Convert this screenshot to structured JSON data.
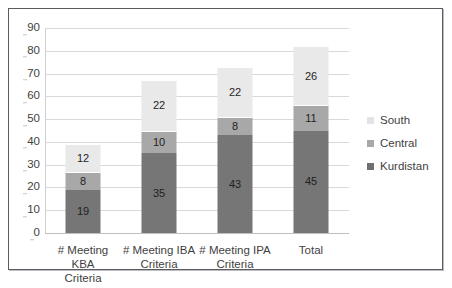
{
  "chart_data": {
    "type": "bar",
    "stacked": true,
    "title": "",
    "subtitle": "",
    "xlabel": "",
    "ylabel": "",
    "ylim": [
      0,
      90
    ],
    "ytick_step": 10,
    "ytick_labels": [
      "0",
      "10",
      "20",
      "30",
      "40",
      "50",
      "60",
      "70",
      "80",
      "90"
    ],
    "grid": true,
    "legend_position": "right",
    "categories": [
      "# Meeting KBA Criteria",
      "# Meeting IBA Criteria",
      "# Meeting IPA Criteria",
      "Total"
    ],
    "category_lines": [
      [
        "# Meeting KBA",
        "Criteria"
      ],
      [
        "# Meeting IBA",
        "Criteria"
      ],
      [
        "# Meeting IPA",
        "Criteria"
      ],
      [
        "Total",
        ""
      ]
    ],
    "series": [
      {
        "name": "Kurdistan",
        "color": "#767676",
        "values": [
          19,
          35,
          43,
          45
        ],
        "labels": [
          "19",
          "35",
          "43",
          "45"
        ]
      },
      {
        "name": "Central",
        "color": "#a8a8a8",
        "values": [
          8,
          10,
          8,
          11
        ],
        "labels": [
          "8",
          "10",
          "8",
          "11"
        ]
      },
      {
        "name": "South",
        "color": "#e9e9e9",
        "values": [
          12,
          22,
          22,
          26
        ],
        "labels": [
          "12",
          "22",
          "22",
          "26"
        ]
      }
    ],
    "totals": [
      39,
      67,
      73,
      82
    ]
  },
  "legend": {
    "items": [
      {
        "label": "South"
      },
      {
        "label": "Central"
      },
      {
        "label": "Kurdistan"
      }
    ]
  }
}
